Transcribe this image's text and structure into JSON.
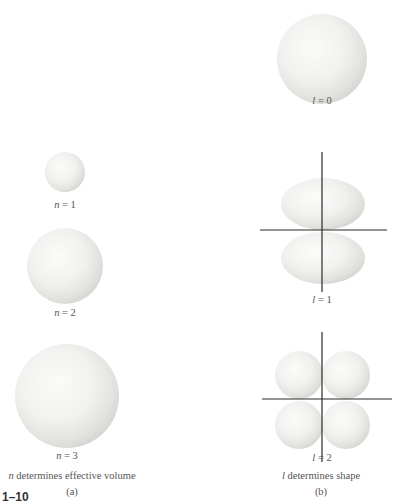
{
  "figure": {
    "number": "1–10",
    "panel_a": {
      "tag": "(a)",
      "caption_var": "n",
      "caption_rest": " determines effective volume",
      "items": [
        {
          "var": "n",
          "eq": " = 1"
        },
        {
          "var": "n",
          "eq": " = 2"
        },
        {
          "var": "n",
          "eq": " = 3"
        }
      ]
    },
    "panel_b": {
      "tag": "(b)",
      "caption_var": "l",
      "caption_rest": " determines shape",
      "items": [
        {
          "var": "l",
          "eq": " = 0"
        },
        {
          "var": "l",
          "eq": " = 1"
        },
        {
          "var": "l",
          "eq": " = 2"
        }
      ]
    }
  },
  "colors": {
    "surface": "#f4f4f3",
    "shadow": "#d2d2d0",
    "axis": "#2a2a2a"
  }
}
